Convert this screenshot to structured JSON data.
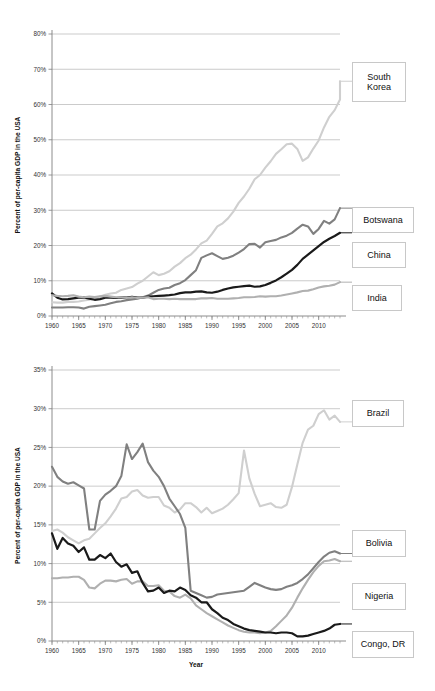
{
  "figure": {
    "background": "#ffffff",
    "width": 435,
    "height": 691
  },
  "chart_data": [
    {
      "id": "top",
      "type": "line",
      "title": "",
      "xlabel": "",
      "ylabel": "Percent of per-capita GDP in the USA",
      "xlim": [
        1960,
        2014
      ],
      "ylim": [
        0,
        80
      ],
      "grid": true,
      "grid_axis": "y",
      "legend_position": "right-outside",
      "xticks": [
        1960,
        1965,
        1970,
        1975,
        1980,
        1985,
        1990,
        1995,
        2000,
        2005,
        2010
      ],
      "xticklabels": [
        "1960",
        "1965",
        "1970",
        "1975",
        "1980",
        "1985",
        "1990",
        "1995",
        "2000",
        "2005",
        "2010"
      ],
      "xtick_minor_step": 1,
      "yticks": [
        0,
        10,
        20,
        30,
        40,
        50,
        60,
        70,
        80
      ],
      "yticklabels": [
        "0%",
        "10%",
        "20%",
        "30%",
        "40%",
        "50%",
        "60%",
        "70%",
        "80%"
      ],
      "x": [
        1960,
        1961,
        1962,
        1963,
        1964,
        1965,
        1966,
        1967,
        1968,
        1969,
        1970,
        1971,
        1972,
        1973,
        1974,
        1975,
        1976,
        1977,
        1978,
        1979,
        1980,
        1981,
        1982,
        1983,
        1984,
        1985,
        1986,
        1987,
        1988,
        1989,
        1990,
        1991,
        1992,
        1993,
        1994,
        1995,
        1996,
        1997,
        1998,
        1999,
        2000,
        2001,
        2002,
        2003,
        2004,
        2005,
        2006,
        2007,
        2008,
        2009,
        2010,
        2011,
        2012,
        2013,
        2014
      ],
      "series": [
        {
          "name": "South Korea",
          "color": "#cfcfcf",
          "width": 2.1,
          "values": [
            3.9,
            3.8,
            3.8,
            4.0,
            4.0,
            4.1,
            4.4,
            4.6,
            5.0,
            5.5,
            6.0,
            6.4,
            6.6,
            7.4,
            7.8,
            8.2,
            9.2,
            10.0,
            11.2,
            12.4,
            11.6,
            12.0,
            12.7,
            14.0,
            15.0,
            16.4,
            17.4,
            18.9,
            20.6,
            21.4,
            23.3,
            25.4,
            26.3,
            27.7,
            29.6,
            32.1,
            33.9,
            36.1,
            38.8,
            40.0,
            42.1,
            43.9,
            46.0,
            47.3,
            48.7,
            48.9,
            47.4,
            44.0,
            45.0,
            47.5,
            49.8,
            53.5,
            56.5,
            58.4,
            61.4
          ],
          "values_extended": [
            62.5,
            64.2,
            64.6,
            66.0,
            66.6
          ]
        },
        {
          "name": "Botswana",
          "color": "#808080",
          "width": 2.1,
          "values": [
            2.4,
            2.4,
            2.4,
            2.5,
            2.5,
            2.4,
            2.1,
            2.6,
            2.8,
            3.0,
            3.2,
            3.6,
            4.0,
            4.2,
            4.5,
            4.7,
            4.9,
            5.3,
            5.8,
            6.6,
            7.4,
            7.8,
            8.0,
            8.8,
            9.3,
            10.2,
            11.6,
            13.0,
            16.5,
            17.2,
            17.8,
            17.0,
            16.2,
            16.5,
            17.1,
            18.0,
            19.0,
            20.4,
            20.5,
            19.4,
            20.9,
            21.3,
            21.6,
            22.3,
            22.8,
            23.6,
            24.8,
            25.9,
            25.4,
            23.3,
            24.7,
            27.0,
            26.2,
            27.4,
            30.6
          ],
          "values_extended": []
        },
        {
          "name": "China",
          "color": "#1a1a1a",
          "width": 2.2,
          "values": [
            6.4,
            5.2,
            4.7,
            4.8,
            5.0,
            5.2,
            5.3,
            4.9,
            4.6,
            4.8,
            5.2,
            5.2,
            5.1,
            5.3,
            5.2,
            5.4,
            5.2,
            5.2,
            5.5,
            5.6,
            5.7,
            5.8,
            5.9,
            6.1,
            6.5,
            6.7,
            6.7,
            6.9,
            7.0,
            6.7,
            6.6,
            6.9,
            7.4,
            7.8,
            8.1,
            8.3,
            8.5,
            8.6,
            8.3,
            8.4,
            8.8,
            9.4,
            10.1,
            11.0,
            12.0,
            13.1,
            14.5,
            16.2,
            17.4,
            18.6,
            19.8,
            21.0,
            21.9,
            22.7,
            23.6
          ],
          "values_extended": []
        },
        {
          "name": "India",
          "color": "#b0b0b0",
          "width": 2.1,
          "values": [
            5.9,
            5.7,
            5.6,
            5.7,
            5.9,
            5.5,
            5.3,
            5.5,
            5.4,
            5.6,
            5.7,
            5.5,
            5.3,
            5.3,
            5.1,
            5.3,
            5.1,
            5.2,
            5.3,
            4.8,
            4.9,
            4.9,
            4.8,
            4.9,
            4.8,
            4.8,
            4.8,
            4.8,
            5.0,
            5.0,
            5.1,
            4.9,
            4.9,
            4.9,
            5.0,
            5.1,
            5.3,
            5.3,
            5.4,
            5.6,
            5.5,
            5.6,
            5.6,
            5.8,
            6.1,
            6.4,
            6.7,
            7.1,
            7.2,
            7.6,
            8.1,
            8.4,
            8.6,
            8.9,
            9.6
          ],
          "values_extended": []
        }
      ],
      "legend": [
        {
          "label": "South Korea",
          "label_lines": [
            "South",
            "Korea"
          ],
          "value_at_end": 66.6
        },
        {
          "label": "Botswana",
          "label_lines": [
            "Botswana"
          ],
          "value_at_end": 30.6
        },
        {
          "label": "China",
          "label_lines": [
            "China"
          ],
          "value_at_end": 23.6
        },
        {
          "label": "India",
          "label_lines": [
            "India"
          ],
          "value_at_end": 9.6
        }
      ]
    },
    {
      "id": "bottom",
      "type": "line",
      "title": "",
      "xlabel": "Year",
      "ylabel": "Percent of per-capita GDP in the USA",
      "xlim": [
        1960,
        2014
      ],
      "ylim": [
        0,
        35
      ],
      "grid": true,
      "grid_axis": "y",
      "legend_position": "right-outside",
      "xticks": [
        1960,
        1965,
        1970,
        1975,
        1980,
        1985,
        1990,
        1995,
        2000,
        2005,
        2010
      ],
      "xticklabels": [
        "1960",
        "1965",
        "1970",
        "1975",
        "1980",
        "1985",
        "1990",
        "1995",
        "2000",
        "2005",
        "2010"
      ],
      "xtick_minor_step": 1,
      "yticks": [
        0,
        5,
        10,
        15,
        20,
        25,
        30,
        35
      ],
      "yticklabels": [
        "0%",
        "5%",
        "10%",
        "15%",
        "20%",
        "25%",
        "30%",
        "35%"
      ],
      "x": [
        1960,
        1961,
        1962,
        1963,
        1964,
        1965,
        1966,
        1967,
        1968,
        1969,
        1970,
        1971,
        1972,
        1973,
        1974,
        1975,
        1976,
        1977,
        1978,
        1979,
        1980,
        1981,
        1982,
        1983,
        1984,
        1985,
        1986,
        1987,
        1988,
        1989,
        1990,
        1991,
        1992,
        1993,
        1994,
        1995,
        1996,
        1997,
        1998,
        1999,
        2000,
        2001,
        2002,
        2003,
        2004,
        2005,
        2006,
        2007,
        2008,
        2009,
        2010,
        2011,
        2012,
        2013,
        2014
      ],
      "series": [
        {
          "name": "Brazil",
          "color": "#cfcfcf",
          "width": 2.1,
          "values": [
            14.2,
            14.4,
            14.0,
            13.4,
            13.0,
            12.6,
            13.0,
            13.2,
            13.9,
            14.6,
            15.2,
            16.1,
            17.1,
            18.4,
            18.6,
            19.3,
            19.5,
            18.8,
            18.5,
            18.6,
            18.6,
            17.5,
            17.2,
            16.6,
            17.0,
            17.8,
            17.8,
            17.3,
            16.6,
            17.2,
            16.5,
            16.8,
            17.1,
            17.6,
            18.3,
            19.1,
            24.6,
            21.0,
            19.0,
            17.4,
            17.6,
            17.8,
            17.3,
            17.2,
            17.6,
            19.9,
            22.8,
            25.6,
            27.3,
            27.8,
            29.3,
            29.8,
            28.6,
            29.1,
            28.3
          ],
          "values_extended": []
        },
        {
          "name": "Bolivia",
          "color": "#808080",
          "width": 2.1,
          "values": [
            22.5,
            21.2,
            20.6,
            20.3,
            20.5,
            20.1,
            19.7,
            14.4,
            14.4,
            18.1,
            18.9,
            19.4,
            20.0,
            21.3,
            25.4,
            23.5,
            24.4,
            25.5,
            23.1,
            22.0,
            21.2,
            20.0,
            18.4,
            17.4,
            16.4,
            14.6,
            6.5,
            6.2,
            5.9,
            5.6,
            5.7,
            6.0,
            6.1,
            6.2,
            6.3,
            6.4,
            6.5,
            7.0,
            7.5,
            7.2,
            6.9,
            6.7,
            6.6,
            6.7,
            7.0,
            7.2,
            7.5,
            8.0,
            8.6,
            9.4,
            10.2,
            10.9,
            11.4,
            11.6,
            11.3
          ],
          "values_extended": []
        },
        {
          "name": "Nigeria",
          "color": "#b0b0b0",
          "width": 2.1,
          "values": [
            8.1,
            8.1,
            8.2,
            8.2,
            8.3,
            8.3,
            7.9,
            6.9,
            6.8,
            7.4,
            7.8,
            7.8,
            7.7,
            7.9,
            8.0,
            7.4,
            7.7,
            7.7,
            7.1,
            7.1,
            7.2,
            6.5,
            6.4,
            5.8,
            5.6,
            6.0,
            5.5,
            4.6,
            4.1,
            3.6,
            3.2,
            2.8,
            2.4,
            2.0,
            1.7,
            1.4,
            1.2,
            1.1,
            1.1,
            1.0,
            1.1,
            1.3,
            1.9,
            2.6,
            3.3,
            4.3,
            5.6,
            6.8,
            7.9,
            8.9,
            9.7,
            10.3,
            10.4,
            10.6,
            10.3
          ],
          "values_extended": []
        },
        {
          "name": "Congo, DR",
          "color": "#1a1a1a",
          "width": 2.2,
          "values": [
            13.9,
            11.9,
            13.3,
            12.6,
            12.3,
            11.5,
            12.1,
            10.5,
            10.5,
            11.1,
            10.7,
            11.3,
            10.2,
            9.6,
            9.9,
            8.8,
            9.0,
            7.5,
            6.4,
            6.5,
            6.9,
            6.2,
            6.5,
            6.4,
            6.9,
            6.6,
            5.9,
            5.6,
            5.0,
            5.0,
            4.1,
            3.6,
            3.0,
            2.7,
            2.2,
            1.9,
            1.6,
            1.4,
            1.3,
            1.2,
            1.1,
            1.1,
            1.0,
            1.1,
            1.1,
            1.0,
            0.6,
            0.6,
            0.7,
            0.9,
            1.1,
            1.3,
            1.6,
            2.1,
            2.2
          ],
          "values_extended": []
        }
      ],
      "legend": [
        {
          "label": "Brazil",
          "label_lines": [
            "Brazil"
          ],
          "value_at_end": 28.3
        },
        {
          "label": "Bolivia",
          "label_lines": [
            "Bolivia"
          ],
          "value_at_end": 11.3
        },
        {
          "label": "Nigeria",
          "label_lines": [
            "Nigeria"
          ],
          "value_at_end": 10.3
        },
        {
          "label": "Congo, DR",
          "label_lines": [
            "Congo, DR"
          ],
          "value_at_end": 2.2
        }
      ]
    }
  ]
}
